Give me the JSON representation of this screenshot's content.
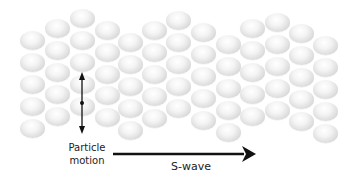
{
  "diagram": {
    "particle_label_line1": "Particle",
    "particle_label_line2": "motion",
    "wave_label": "S-wave",
    "colors": {
      "arrow": "#111111",
      "text": "#222222",
      "ball_light": "#ffffff",
      "ball_shadow": "#bdbdbd"
    },
    "columns": [
      {
        "x": 32,
        "y": [
          40,
          62,
          84,
          106,
          128
        ]
      },
      {
        "x": 57,
        "y": [
          28,
          50,
          72,
          94,
          116
        ]
      },
      {
        "x": 82,
        "y": [
          18,
          40,
          62,
          84,
          106
        ]
      },
      {
        "x": 107,
        "y": [
          30,
          52,
          74,
          95,
          117
        ]
      },
      {
        "x": 130,
        "y": [
          42,
          64,
          86,
          108,
          130
        ]
      },
      {
        "x": 154,
        "y": [
          30,
          52,
          74,
          96,
          118
        ]
      },
      {
        "x": 178,
        "y": [
          20,
          42,
          64,
          86,
          108
        ]
      },
      {
        "x": 203,
        "y": [
          32,
          54,
          76,
          98,
          120
        ]
      },
      {
        "x": 228,
        "y": [
          44,
          66,
          88,
          110,
          132
        ]
      },
      {
        "x": 252,
        "y": [
          28,
          50,
          72,
          94,
          116
        ]
      },
      {
        "x": 277,
        "y": [
          22,
          44,
          66,
          88,
          110
        ]
      },
      {
        "x": 301,
        "y": [
          33,
          55,
          77,
          99,
          121
        ]
      },
      {
        "x": 325,
        "y": [
          45,
          67,
          89,
          111,
          133
        ]
      }
    ]
  }
}
